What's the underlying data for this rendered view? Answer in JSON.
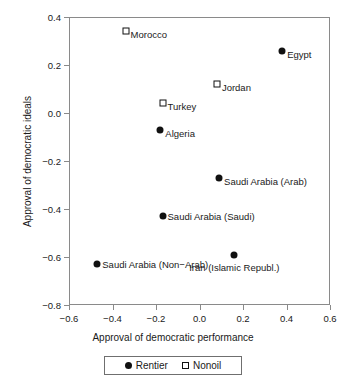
{
  "chart_data": {
    "type": "scatter",
    "title": "",
    "xlabel": "Approval of democratic performance",
    "ylabel": "Approval of democratic ideals",
    "xlim": [
      -0.6,
      0.6
    ],
    "ylim": [
      -0.8,
      0.4
    ],
    "xticks": [
      -0.6,
      -0.4,
      -0.2,
      0.0,
      0.2,
      0.4,
      0.6
    ],
    "xticklabels": [
      "−0.6",
      "−0.4",
      "−0.2",
      "0.0",
      "0.2",
      "0.4",
      "0.6"
    ],
    "yticks": [
      -0.8,
      -0.6,
      -0.4,
      -0.2,
      0.0,
      0.2,
      0.4
    ],
    "yticklabels": [
      "−0.8",
      "−0.6",
      "−0.4",
      "−0.2",
      "0.0",
      "0.2",
      "0.4"
    ],
    "grid": false,
    "legend_position": "below-axis-center",
    "series": [
      {
        "name": "Rentier",
        "marker": "filled-circle",
        "color": "#111111",
        "points": [
          {
            "label": "Egypt",
            "x": 0.38,
            "y": 0.26,
            "label_side": "right-below"
          },
          {
            "label": "Algeria",
            "x": -0.18,
            "y": -0.07,
            "label_side": "right-below"
          },
          {
            "label": "Saudi Arabia (Arab)",
            "x": 0.09,
            "y": -0.27,
            "label_side": "right-below"
          },
          {
            "label": "Saudi Arabia (Saudi)",
            "x": -0.17,
            "y": -0.43,
            "label_side": "right"
          },
          {
            "label": "Saudi Arabia (Non−Arab)",
            "x": -0.47,
            "y": -0.63,
            "label_side": "right"
          },
          {
            "label": "Iran (Islamic Republ.)",
            "x": 0.16,
            "y": -0.59,
            "label_side": "below-center"
          }
        ]
      },
      {
        "name": "Nonoil",
        "marker": "open-square",
        "color": "#111111",
        "points": [
          {
            "label": "Morocco",
            "x": -0.34,
            "y": 0.34,
            "label_side": "right-below"
          },
          {
            "label": "Jordan",
            "x": 0.08,
            "y": 0.12,
            "label_side": "right-below"
          },
          {
            "label": "Turkey",
            "x": -0.17,
            "y": 0.04,
            "label_side": "right-below"
          }
        ]
      }
    ]
  },
  "legend": {
    "entries": [
      {
        "label": "Rentier",
        "marker": "filled-circle"
      },
      {
        "label": "Nonoil",
        "marker": "open-square"
      }
    ]
  }
}
